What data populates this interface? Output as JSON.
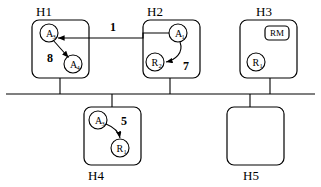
{
  "diagram": {
    "background_color": "#ffffff",
    "line_color": "#000000",
    "hosts": [
      {
        "id": "H1",
        "label": "H1",
        "x": 32,
        "y": 20,
        "w": 57,
        "h": 58
      },
      {
        "id": "H2",
        "label": "H2",
        "x": 143,
        "y": 20,
        "w": 57,
        "h": 58
      },
      {
        "id": "H3",
        "label": "H3",
        "x": 240,
        "y": 20,
        "w": 57,
        "h": 58
      },
      {
        "id": "H4",
        "label": "H4",
        "x": 84,
        "y": 107,
        "w": 57,
        "h": 58
      },
      {
        "id": "H5",
        "label": "H5",
        "x": 227,
        "y": 107,
        "w": 57,
        "h": 58
      }
    ],
    "bus": {
      "label": "network-bus",
      "y": 94,
      "x1": 6,
      "x2": 315
    },
    "nodes": [
      {
        "id": "h1-a-top",
        "base": "A",
        "sub": "3",
        "cx": 49,
        "cy": 33
      },
      {
        "id": "h1-a-bottom",
        "base": "A",
        "sub": "4",
        "cx": 73,
        "cy": 64
      },
      {
        "id": "h2-a",
        "base": "A",
        "sub": "1",
        "cx": 178,
        "cy": 33
      },
      {
        "id": "h2-r",
        "base": "R",
        "sub": "2",
        "cx": 155,
        "cy": 62
      },
      {
        "id": "h3-r",
        "base": "R",
        "sub": "1",
        "cx": 256,
        "cy": 62
      },
      {
        "id": "h4-a",
        "base": "A",
        "sub": "3",
        "cx": 98,
        "cy": 120
      },
      {
        "id": "h4-r",
        "base": "R",
        "sub": "1",
        "cx": 120,
        "cy": 148
      }
    ],
    "rm_box": {
      "label": "RM",
      "x": 265,
      "y": 26,
      "w": 24,
      "h": 14
    },
    "edges": [
      {
        "id": "edge-1",
        "label": "1",
        "from": "h2-a",
        "to": "h1-a-top",
        "label_x": 113,
        "label_y": 30
      },
      {
        "id": "edge-8",
        "label": "8",
        "from": "h1-a-top",
        "to": "h1-a-bottom",
        "label_x": 50,
        "label_y": 59
      },
      {
        "id": "edge-7",
        "label": "7",
        "from": "h2-a",
        "to": "h2-r",
        "label_x": 185,
        "label_y": 67
      },
      {
        "id": "edge-5",
        "label": "5",
        "from": "h4-a",
        "to": "h4-r",
        "label_x": 123,
        "label_y": 124
      }
    ]
  }
}
